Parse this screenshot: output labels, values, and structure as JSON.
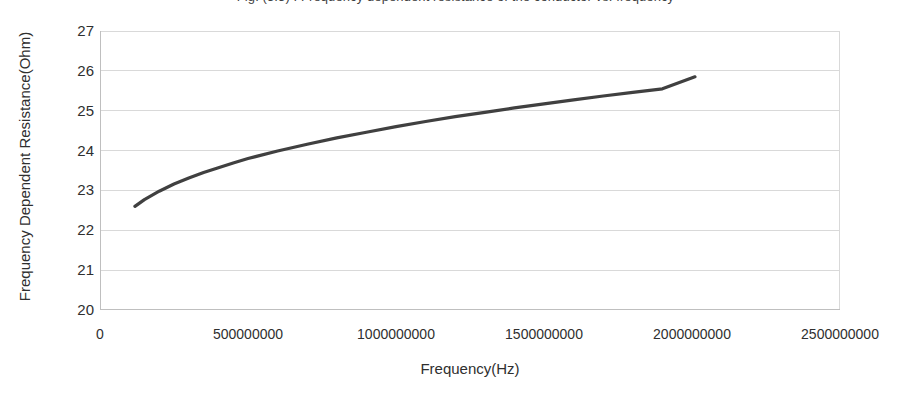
{
  "chart_data": {
    "type": "line",
    "title": "Fig. (3.3) : Frequency dependent resistance of the conductor vs. frequency",
    "xlabel": "Frequency(Hz)",
    "ylabel": "Frequency Dependent Resistance(Ohm)",
    "xlim": [
      0,
      2500000000
    ],
    "ylim": [
      20,
      27
    ],
    "xticks": [
      0,
      500000000,
      1000000000,
      1500000000,
      2000000000,
      2500000000
    ],
    "xticklabels": [
      "0",
      "500000000",
      "1000000000",
      "1500000000",
      "2000000000",
      "2500000000"
    ],
    "yticks": [
      20,
      21,
      22,
      23,
      24,
      25,
      26,
      27
    ],
    "yticklabels": [
      "20",
      "21",
      "22",
      "23",
      "24",
      "25",
      "26",
      "27"
    ],
    "grid": "horizontal",
    "legend": "none",
    "series": [
      {
        "name": "Frequency Dependent Resistance",
        "color": "#404040",
        "line_width": 3.2,
        "x": [
          118000000,
          150000000,
          200000000,
          250000000,
          300000000,
          350000000,
          400000000,
          450000000,
          500000000,
          600000000,
          700000000,
          800000000,
          900000000,
          1000000000,
          1100000000,
          1200000000,
          1300000000,
          1400000000,
          1500000000,
          1600000000,
          1700000000,
          1800000000,
          1900000000,
          2010000000
        ],
        "y": [
          22.6,
          22.77,
          22.98,
          23.16,
          23.31,
          23.45,
          23.57,
          23.69,
          23.8,
          23.99,
          24.16,
          24.32,
          24.46,
          24.6,
          24.73,
          24.85,
          24.96,
          25.07,
          25.17,
          25.27,
          25.37,
          25.46,
          25.55,
          25.85
        ]
      }
    ]
  },
  "axes": {
    "x_title": "Frequency(Hz)",
    "y_title": "Frequency Dependent Resistance(Ohm)"
  },
  "colors": {
    "series": "#404040",
    "grid": "#d9d9d9",
    "axis": "#bfbfbf",
    "text": "#2f2f2f",
    "background": "#ffffff"
  }
}
